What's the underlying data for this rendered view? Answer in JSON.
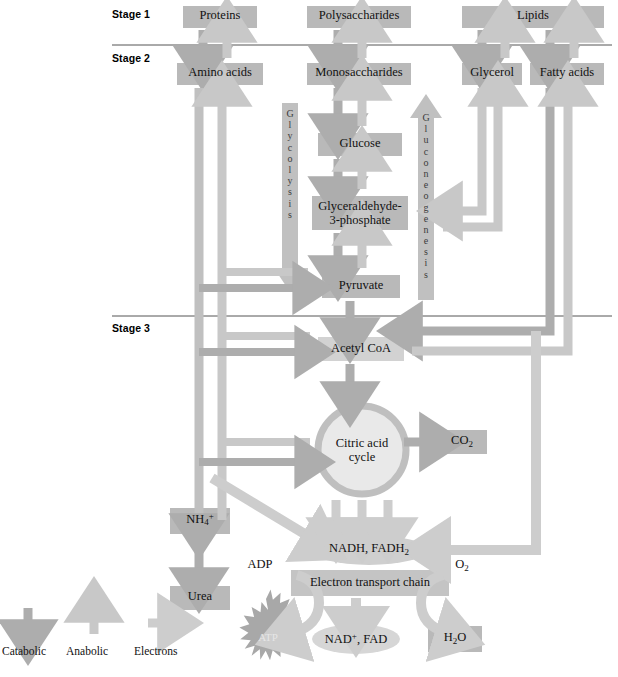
{
  "stages": [
    {
      "id": "stage1",
      "label": "Stage 1"
    },
    {
      "id": "stage2",
      "label": "Stage 2"
    },
    {
      "id": "stage3",
      "label": "Stage 3"
    }
  ],
  "nodes": {
    "proteins": "Proteins",
    "polysaccharides": "Polysaccharides",
    "lipids": "Lipids",
    "amino_acids": "Amino acids",
    "monosaccharides": "Monosaccharides",
    "glycerol": "Glycerol",
    "fatty_acids": "Fatty acids",
    "glucose": "Glucose",
    "glyceraldehyde": "Glyceraldehyde-\n3-phosphate",
    "glyceraldehyde_l1": "Glyceraldehyde-",
    "glyceraldehyde_l2": "3-phosphate",
    "pyruvate": "Pyruvate",
    "acetyl_coa": "Acetyl CoA",
    "citric_acid_l1": "Citric acid",
    "citric_acid_l2": "cycle",
    "co2": "CO2",
    "nh4": "NH4+",
    "urea": "Urea",
    "nadh_fadh2": "NADH, FADH2",
    "electron_transport_chain": "Electron transport chain",
    "adp": "ADP",
    "o2": "O2",
    "atp": "ATP",
    "nad_fad": "NAD+, FAD",
    "h2o": "H2O"
  },
  "pathways": {
    "glycolysis": "Glycolysis",
    "gluconeogenesis": "Gluconeogenesis"
  },
  "legend": [
    {
      "key": "catabolic",
      "label": "Catabolic",
      "direction": "down",
      "color": "#a8a8a8"
    },
    {
      "key": "anabolic",
      "label": "Anabolic",
      "direction": "up",
      "color": "#c6c6c6"
    },
    {
      "key": "electrons",
      "label": "Electrons",
      "direction": "right",
      "color": "#cccccc"
    }
  ],
  "colors": {
    "box_fill": "#b9b9b9",
    "box_fill_light": "#d2d2d2",
    "catabolic_arrow": "#adadad",
    "anabolic_arrow": "#c8c8c8",
    "electron_arrow": "#cdcdcd",
    "divider": "#555555",
    "circle_ring": "#bfbfbf",
    "circle_fill": "#e9e9e9",
    "text": "#111111"
  }
}
